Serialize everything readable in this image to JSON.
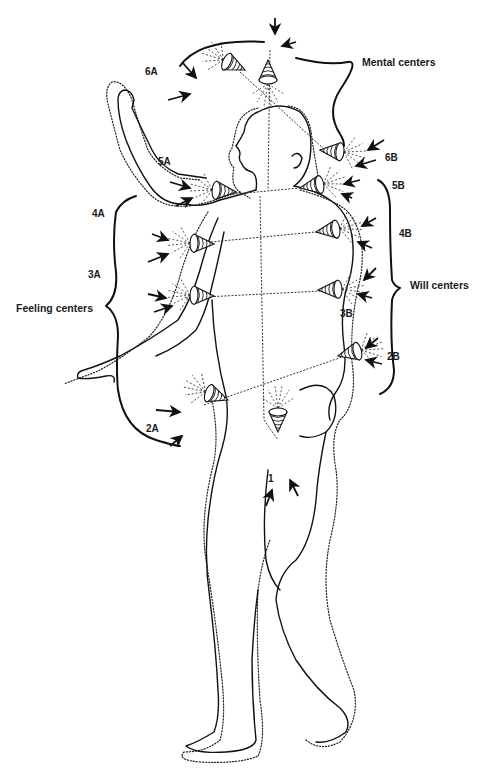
{
  "diagram": {
    "type": "human energy centers (chakra) illustration",
    "groups": [
      {
        "id": "mental",
        "label": "Mental centers",
        "members": [
          "6A",
          "6B",
          "7"
        ]
      },
      {
        "id": "feeling",
        "label": "Feeling centers",
        "members": [
          "2A",
          "3A",
          "4A",
          "5A"
        ]
      },
      {
        "id": "will",
        "label": "Will centers",
        "members": [
          "2B",
          "3B",
          "4B",
          "5B"
        ]
      }
    ],
    "centers": [
      {
        "label": "1"
      },
      {
        "label": "2A"
      },
      {
        "label": "2B"
      },
      {
        "label": "3A"
      },
      {
        "label": "3B"
      },
      {
        "label": "4A"
      },
      {
        "label": "4B"
      },
      {
        "label": "5A"
      },
      {
        "label": "5B"
      },
      {
        "label": "6A"
      },
      {
        "label": "6B"
      }
    ],
    "colors": {
      "ink": "#111111",
      "background": "#ffffff"
    }
  }
}
